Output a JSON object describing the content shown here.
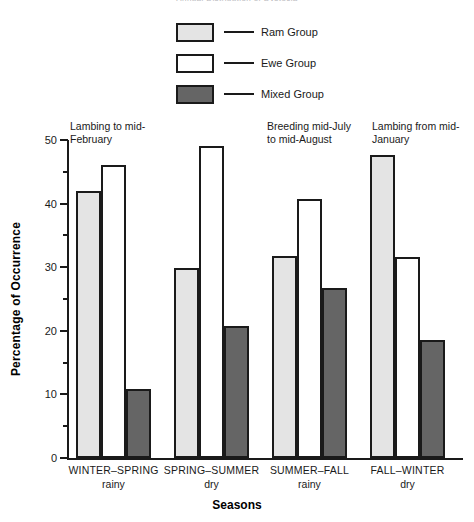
{
  "clipped_title": "Annual Distribution of Dystocia",
  "legend": {
    "items": [
      {
        "label": "Ram Group",
        "swatch": "light-gray",
        "color": "#e4e4e4"
      },
      {
        "label": "Ewe Group",
        "swatch": "white",
        "color": "#ffffff"
      },
      {
        "label": "Mixed Group",
        "swatch": "dark-gray",
        "color": "#656565"
      }
    ]
  },
  "annotations": [
    {
      "text": "Lambing to mid-\nFebruary",
      "x": 70,
      "y": 120
    },
    {
      "text": "Breeding mid-July\nto mid-August",
      "x": 267,
      "y": 120
    },
    {
      "text": "Lambing from mid-\nJanuary",
      "x": 372,
      "y": 120
    }
  ],
  "axes": {
    "ylabel": "Percentage of Occurrence",
    "xlabel": "Seasons",
    "yticks": [
      0,
      10,
      20,
      30,
      40,
      50
    ],
    "yticks_minor": [
      5,
      15,
      25,
      35,
      45
    ],
    "ymin": 0,
    "ymax": 50
  },
  "chart_data": {
    "type": "bar",
    "title": "Annual Distribution of Dystocia",
    "xlabel": "Seasons",
    "ylabel": "Percentage of Occurrence",
    "ylim": [
      0,
      50
    ],
    "grid": false,
    "legend_position": "top-center",
    "categories": [
      "WINTER–SPRING",
      "SPRING–SUMMER",
      "SUMMER–FALL",
      "FALL–WINTER"
    ],
    "category_sublabels": [
      "rainy",
      "dry",
      "rainy",
      "dry"
    ],
    "series": [
      {
        "name": "Ram Group",
        "color": "#e4e4e4",
        "values": [
          42.0,
          29.8,
          31.7,
          47.7
        ]
      },
      {
        "name": "Ewe Group",
        "color": "#ffffff",
        "values": [
          46.0,
          49.0,
          40.7,
          31.6
        ]
      },
      {
        "name": "Mixed Group",
        "color": "#656565",
        "values": [
          10.8,
          20.7,
          26.7,
          18.5
        ]
      }
    ],
    "annotations": [
      "Lambing to mid-February",
      "Breeding mid-July to mid-August",
      "Lambing from mid-January"
    ]
  }
}
